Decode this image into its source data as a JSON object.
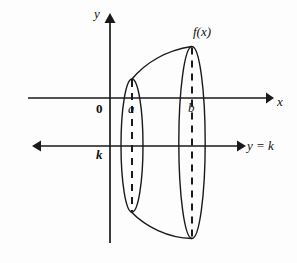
{
  "figure": {
    "background_color": "#fdfdfd",
    "ink_color": "#1a1a1a"
  },
  "labels": {
    "y_axis": "y",
    "x_axis": "x",
    "function": "f(x)",
    "origin": "0",
    "left_bound": "a",
    "right_bound": "b",
    "k_value": "k",
    "axis_of_revolution": "y = k"
  },
  "icons": {
    "y_axis_arrow": "arrow-up-icon",
    "x_axis_arrow": "arrow-right-icon",
    "revolution_left_arrow": "arrow-left-icon",
    "revolution_right_arrow": "arrow-right-icon"
  },
  "geometry": {
    "y_axis": {
      "x": 110,
      "top": 14,
      "bottom": 243
    },
    "x_axis": {
      "y": 98,
      "left": 28,
      "right": 272
    },
    "line_y_equals_k": {
      "y": 146,
      "left": 33,
      "right": 245
    },
    "cross_section_a": {
      "cx": 132,
      "cy": 145,
      "rx": 11,
      "ry": 67
    },
    "cross_section_b": {
      "cx": 192,
      "cy": 142,
      "rx": 13,
      "ry": 96
    },
    "top_curve": {
      "from": [
        132,
        79
      ],
      "to": [
        192,
        47
      ]
    },
    "bottom_curve": {
      "from": [
        131,
        212
      ],
      "to": [
        192,
        238
      ]
    }
  }
}
